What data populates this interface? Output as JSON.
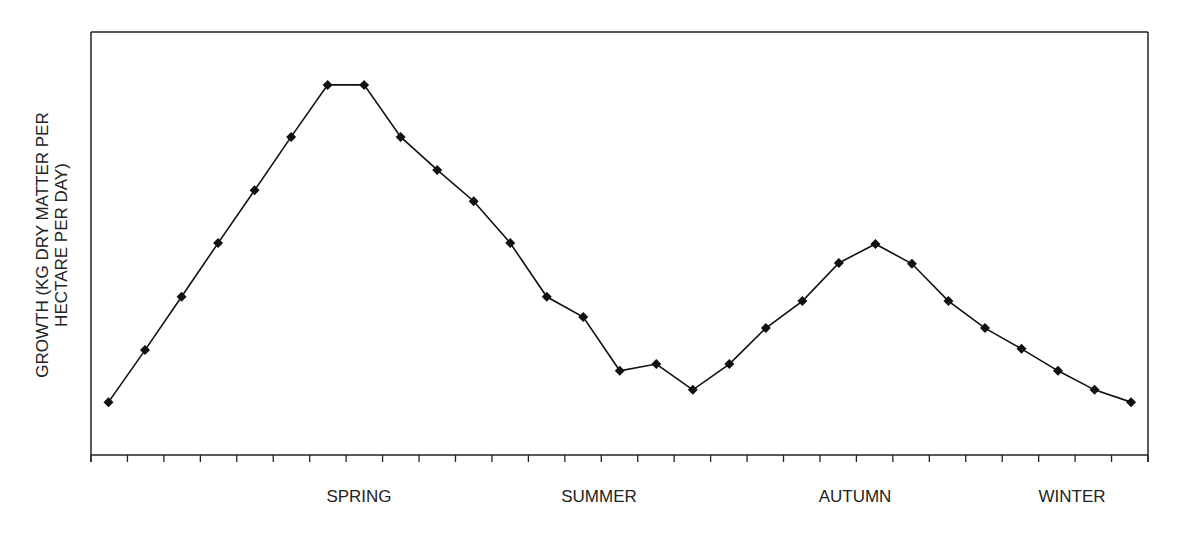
{
  "chart_data": {
    "type": "line",
    "title": "",
    "xlabel": "",
    "ylabel": "GROWTH (KG DRY MATTER PER HECTARE PER DAY)",
    "ylabel_lines": [
      "GROWTH (KG DRY MATTER PER",
      "HECTARE PER DAY)"
    ],
    "y_units_note": "relative scale 0-100 (no numeric y ticks shown)",
    "ylim": [
      0,
      100
    ],
    "grid": false,
    "legend": null,
    "x_tick_count": 30,
    "season_labels": [
      {
        "label": "SPRING",
        "x_index": 7.5
      },
      {
        "label": "SUMMER",
        "x_index": 13.5
      },
      {
        "label": "AUTUMN",
        "x_index": 21
      },
      {
        "label": "WINTER",
        "x_index": 26.5
      }
    ],
    "x": [
      1,
      2,
      3,
      4,
      5,
      6,
      7,
      8,
      9,
      10,
      11,
      12,
      13,
      14,
      15,
      16,
      17,
      18,
      19,
      20,
      21,
      22,
      23,
      24,
      25,
      26,
      27,
      28,
      29
    ],
    "series": [
      {
        "name": "Pasture growth",
        "marker": "diamond",
        "color": "#111111",
        "values": [
          12.5,
          24.8,
          37.4,
          50.1,
          62.6,
          75.2,
          87.5,
          87.5,
          75.2,
          67.4,
          60.0,
          50.1,
          37.4,
          32.6,
          19.9,
          21.5,
          15.4,
          21.5,
          30.0,
          36.4,
          45.4,
          49.9,
          45.2,
          36.4,
          30.0,
          25.1,
          19.9,
          15.4,
          12.5
        ]
      }
    ]
  }
}
